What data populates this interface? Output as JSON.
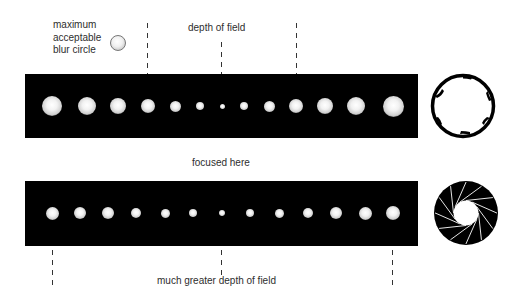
{
  "labels": {
    "blur_circle": [
      "maximum",
      "acceptable",
      "blur circle"
    ],
    "depth_of_field": "depth of field",
    "focused_here": "focused here",
    "greater_depth": "much greater depth of field"
  },
  "top_strip": {
    "aperture": "wide",
    "dot_diameters": [
      20,
      18,
      16,
      14,
      11,
      8,
      5,
      8,
      11,
      14,
      16,
      18,
      21
    ],
    "dot_x": [
      52,
      87,
      118,
      148,
      175,
      200,
      222,
      244,
      269,
      296,
      325,
      356,
      393
    ]
  },
  "bottom_strip": {
    "aperture": "narrow",
    "dot_diameters": [
      13,
      12,
      12,
      10,
      9,
      8,
      6,
      8,
      9,
      10,
      12,
      13,
      14
    ],
    "dot_x": [
      52,
      80,
      108,
      136,
      165,
      193,
      222,
      250,
      279,
      308,
      336,
      365,
      393
    ]
  },
  "icons": {
    "top": "wide-aperture-icon",
    "bottom": "narrow-aperture-icon"
  }
}
